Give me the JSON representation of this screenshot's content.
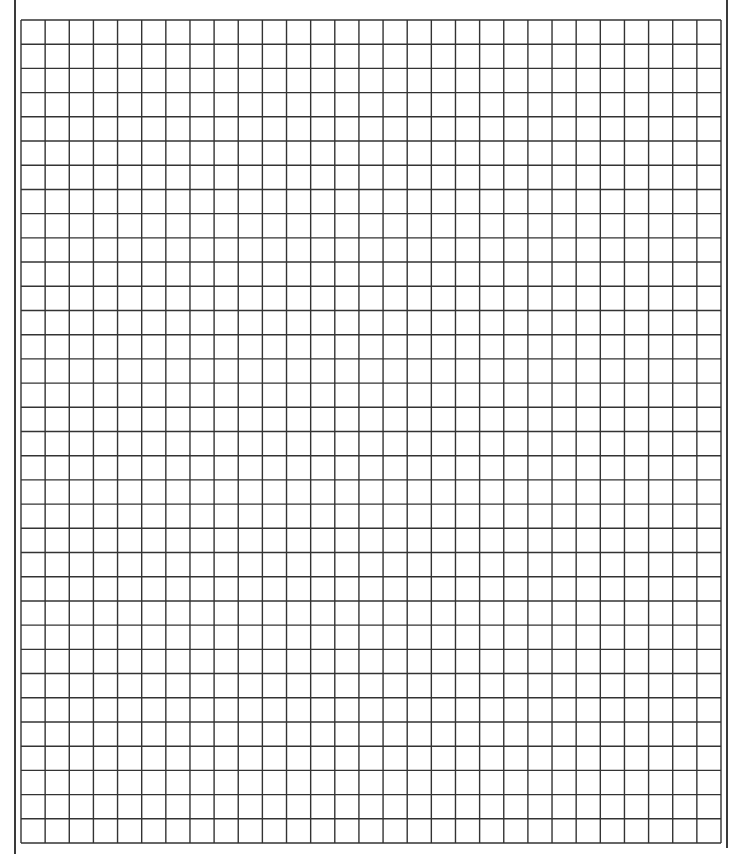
{
  "sheet": {
    "type": "graph-paper",
    "columns": 29,
    "rows": 34,
    "cell_size_px": 24.15,
    "line_color": "#333333",
    "frame_color": "#3a3a3a",
    "background": "#ffffff"
  }
}
